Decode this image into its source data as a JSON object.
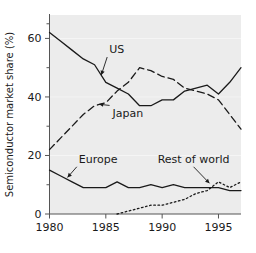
{
  "chart_data": {
    "type": "line",
    "title": "",
    "xlabel": "",
    "ylabel": "Semiconductor market share (%)",
    "xlim": [
      1980,
      1997
    ],
    "ylim": [
      0,
      68
    ],
    "xticks": [
      1980,
      1985,
      1990,
      1995
    ],
    "xtick_labels": [
      "1980",
      "1985",
      "1990",
      "1995"
    ],
    "yticks": [
      0,
      20,
      40,
      60
    ],
    "ytick_labels": [
      "0",
      "20",
      "40",
      "60"
    ],
    "yminorticks": [
      10,
      30,
      50,
      65
    ],
    "grid": false,
    "legend_position": "inline-annotations",
    "series": [
      {
        "name": "US",
        "style": "solid",
        "label": "US",
        "x": [
          1980,
          1981,
          1982,
          1983,
          1984,
          1985,
          1986,
          1987,
          1988,
          1989,
          1990,
          1991,
          1992,
          1993,
          1994,
          1995,
          1996,
          1997
        ],
        "values": [
          62,
          59,
          56,
          53,
          51,
          45,
          43,
          41,
          37,
          37,
          39,
          39,
          42,
          43,
          44,
          41,
          45,
          50
        ]
      },
      {
        "name": "Japan",
        "style": "dashed",
        "label": "Japan",
        "x": [
          1980,
          1981,
          1982,
          1983,
          1984,
          1985,
          1986,
          1987,
          1988,
          1989,
          1990,
          1991,
          1992,
          1993,
          1994,
          1995,
          1996,
          1997
        ],
        "values": [
          22,
          26,
          30,
          34,
          37,
          38,
          42,
          45,
          50,
          49,
          47,
          46,
          43,
          42,
          41,
          39,
          34,
          29
        ]
      },
      {
        "name": "Europe",
        "style": "solid",
        "label": "Europe",
        "x": [
          1980,
          1981,
          1982,
          1983,
          1984,
          1985,
          1986,
          1987,
          1988,
          1989,
          1990,
          1991,
          1992,
          1993,
          1994,
          1995,
          1996,
          1997
        ],
        "values": [
          15,
          13,
          11,
          9,
          9,
          9,
          11,
          9,
          9,
          10,
          9,
          10,
          9,
          9,
          9,
          9,
          8,
          8
        ]
      },
      {
        "name": "Rest of world",
        "style": "dotted",
        "label": "Rest of world",
        "x": [
          1986,
          1987,
          1988,
          1989,
          1990,
          1991,
          1992,
          1993,
          1994,
          1995,
          1996,
          1997
        ],
        "values": [
          0,
          1,
          2,
          3,
          3,
          4,
          5,
          7,
          8,
          11,
          9,
          11
        ]
      }
    ],
    "annotations": [
      {
        "label": "US",
        "text_x": 1985.3,
        "text_y": 55,
        "point_x": 1984.6,
        "point_y": 47.5
      },
      {
        "label": "Japan",
        "text_x": 1985.6,
        "text_y": 33,
        "point_x": 1984.4,
        "point_y": 37.5
      },
      {
        "label": "Europe",
        "text_x": 1982.6,
        "text_y": 17.5,
        "point_x": 1981.6,
        "point_y": 12.5
      },
      {
        "label": "Rest of world",
        "text_x": 1989.6,
        "text_y": 17.5,
        "point_x": 1994.2,
        "point_y": 10.5
      }
    ],
    "colors": {
      "line": "#1a1a1a",
      "axis": "#555555",
      "plot_background": "#ececec",
      "figure_background": "#ffffff"
    }
  }
}
